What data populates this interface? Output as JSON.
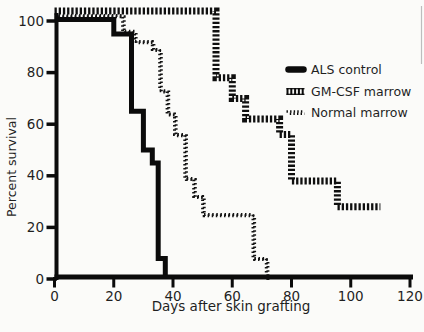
{
  "figure": {
    "background": "#fbfbf9",
    "ink_color": "#0b0b0b",
    "muted_label_color": "#3c3c3c"
  },
  "chart_data": {
    "type": "line",
    "subtype": "kaplan-meier-step-survival",
    "title": "",
    "xlabel": "Days after skin grafting",
    "ylabel": "Percent survival",
    "xlim": [
      0,
      120
    ],
    "ylim": [
      0,
      100
    ],
    "x_ticks": [
      0,
      20,
      40,
      60,
      80,
      100,
      120
    ],
    "y_ticks": [
      0,
      20,
      40,
      60,
      80,
      100
    ],
    "grid": false,
    "legend_position": "inside-upper-right",
    "series": [
      {
        "name": "ALS control",
        "style": "solid-thick",
        "color": "#0b0b0b",
        "points": [
          [
            0,
            100
          ],
          [
            20,
            100
          ],
          [
            20,
            95
          ],
          [
            26,
            95
          ],
          [
            26,
            65
          ],
          [
            30,
            65
          ],
          [
            30,
            50
          ],
          [
            33,
            50
          ],
          [
            33,
            45
          ],
          [
            35,
            45
          ],
          [
            35,
            8
          ],
          [
            37.4,
            8
          ],
          [
            37.4,
            0
          ]
        ]
      },
      {
        "name": "GM-CSF marrow",
        "style": "railroad-striped",
        "color": "#0f0f0f",
        "points": [
          [
            0,
            100
          ],
          [
            54.5,
            100
          ],
          [
            54.5,
            78
          ],
          [
            60,
            78
          ],
          [
            60,
            70
          ],
          [
            64.5,
            70
          ],
          [
            64.5,
            62
          ],
          [
            76,
            62
          ],
          [
            76,
            56
          ],
          [
            80,
            56
          ],
          [
            80,
            38
          ],
          [
            95.5,
            38
          ],
          [
            95.5,
            28
          ],
          [
            110,
            28
          ]
        ]
      },
      {
        "name": "Normal marrow",
        "style": "stippled",
        "color": "#141414",
        "points": [
          [
            0,
            100
          ],
          [
            23,
            100
          ],
          [
            23,
            96
          ],
          [
            27,
            96
          ],
          [
            27,
            92
          ],
          [
            33,
            92
          ],
          [
            33,
            89
          ],
          [
            35.5,
            89
          ],
          [
            35.5,
            73
          ],
          [
            38,
            73
          ],
          [
            38,
            64
          ],
          [
            40.5,
            64
          ],
          [
            40.5,
            56
          ],
          [
            44,
            56
          ],
          [
            44,
            39
          ],
          [
            47,
            39
          ],
          [
            47,
            32
          ],
          [
            50,
            32
          ],
          [
            50,
            25
          ],
          [
            67,
            25
          ],
          [
            67,
            8
          ],
          [
            71.5,
            8
          ],
          [
            71.5,
            0
          ]
        ]
      }
    ]
  },
  "legend": {
    "items": [
      {
        "label": "ALS control",
        "swatch": "solid-bar"
      },
      {
        "label": "GM-CSF marrow",
        "swatch": "striped-bar"
      },
      {
        "label": "Normal marrow",
        "swatch": "stipple-dots"
      }
    ]
  }
}
